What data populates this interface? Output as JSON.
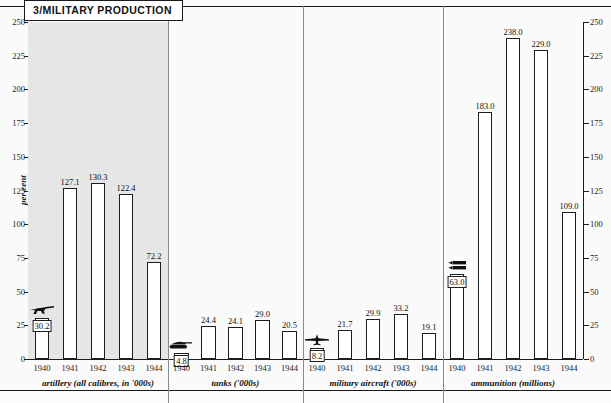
{
  "title": "3/MILITARY PRODUCTION",
  "axis": {
    "ylabel": "per cent",
    "ticks": [
      0,
      25,
      50,
      75,
      100,
      125,
      150,
      175,
      200,
      225,
      250
    ],
    "ymin": 0,
    "ymax": 250
  },
  "chart_data": {
    "type": "bar",
    "title": "3/MILITARY PRODUCTION",
    "xlabel": "",
    "ylabel": "per cent",
    "ylim": [
      0,
      250
    ],
    "grid": false,
    "legend": "none",
    "categories": [
      "1940",
      "1941",
      "1942",
      "1943",
      "1944"
    ],
    "panels": [
      {
        "label": "artillery (all calibres, in '000s)",
        "icon": "cannon-icon",
        "shaded": true,
        "categories": [
          "1940",
          "1941",
          "1942",
          "1943",
          "1944"
        ],
        "values": [
          30.2,
          127.1,
          130.3,
          122.4,
          72.2
        ],
        "value_labels": [
          "30.2",
          "127.1",
          "130.3",
          "122.4",
          "72.2"
        ]
      },
      {
        "label": "tanks ('000s)",
        "icon": "tank-icon",
        "shaded": false,
        "categories": [
          "1940",
          "1941",
          "1942",
          "1943",
          "1944"
        ],
        "values": [
          4.8,
          24.4,
          24.1,
          29.0,
          20.5
        ],
        "value_labels": [
          "4.8",
          "24.4",
          "24.1",
          "29.0",
          "20.5"
        ]
      },
      {
        "label": "military aircraft ('000s)",
        "icon": "airplane-icon",
        "shaded": false,
        "categories": [
          "1940",
          "1941",
          "1942",
          "1943",
          "1944"
        ],
        "values": [
          8.2,
          21.7,
          29.9,
          33.2,
          19.1
        ],
        "value_labels": [
          "8.2",
          "21.7",
          "29.9",
          "33.2",
          "19.1"
        ]
      },
      {
        "label": "ammunition (millions)",
        "icon": "ammunition-icon",
        "shaded": false,
        "categories": [
          "1940",
          "1941",
          "1942",
          "1943",
          "1944"
        ],
        "values": [
          63.0,
          183.0,
          238.0,
          229.0,
          109.0
        ],
        "value_labels": [
          "63.0",
          "183.0",
          "238.0",
          "229.0",
          "109.0"
        ]
      }
    ]
  },
  "colors": {
    "ink": "#1d1d1d",
    "bar_fill": "#ffffff",
    "panel_shaded": "#e6e6e6",
    "panel_plain": "#fafafa",
    "page": "#fbfbfb"
  }
}
